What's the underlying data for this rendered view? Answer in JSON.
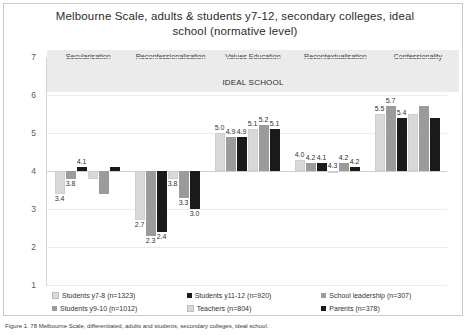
{
  "chart_data": {
    "type": "bar",
    "title": "Melbourne Scale, adults & students y7-12, secondary colleges, ideal school (normative level)",
    "subtitle": "IDEAL SCHOOL",
    "xlabel": "",
    "ylabel": "",
    "ylim": [
      1,
      7
    ],
    "yticks": [
      7,
      6,
      5,
      4,
      3,
      2,
      1
    ],
    "grid": true,
    "legend_position": "bottom",
    "baseline": 4,
    "categories": [
      "Secularisation",
      "Reconfessionalisation",
      "Values Education",
      "Recontextualisation",
      "Confessionality"
    ],
    "series": [
      {
        "name": "Students y7-8 (n=1323)",
        "color": "#d9d9d9",
        "values": [
          3.4,
          2.7,
          5.0,
          4.3,
          5.5
        ]
      },
      {
        "name": "Students y9-10 (n=1012)",
        "color": "#9b9b9b",
        "values": [
          3.8,
          2.3,
          4.9,
          4.2,
          5.7
        ]
      },
      {
        "name": "Students y11-12 (n=920)",
        "color": "#1a1a1a",
        "values": [
          4.1,
          2.4,
          4.9,
          4.2,
          5.4
        ]
      },
      {
        "name": "Teachers (n=804)",
        "color": "#d9d9d9",
        "values": [
          3.8,
          3.8,
          5.1,
          4.0,
          5.5
        ]
      },
      {
        "name": "School leadership (n=307)",
        "color": "#9b9b9b",
        "values": [
          3.4,
          3.3,
          5.2,
          4.2,
          5.7
        ]
      },
      {
        "name": "Parents (n=378)",
        "color": "#1a1a1a",
        "values": [
          4.1,
          3.0,
          5.1,
          4.1,
          5.4
        ]
      }
    ],
    "value_labels": {
      "Secularisation": [
        "3.4",
        "3.8",
        "4.1"
      ],
      "Reconfessionalisation": [
        "2.7",
        "2.3",
        "2.4",
        "3.8",
        "3.3",
        "3.0"
      ],
      "Values Education": [
        "5.0",
        "4.9",
        "4.9",
        "5.1",
        "5.2",
        "5.1"
      ],
      "Recontextualisation": [
        "4.0",
        "4.2",
        "4.1",
        "4.3",
        "4.2",
        "4.2"
      ],
      "Confessionality": [
        "5.5",
        "5.7",
        "5.4"
      ]
    }
  },
  "legend": {
    "items": [
      {
        "label": "Students y7-8 (n=1323)",
        "color": "#d9d9d9"
      },
      {
        "label": "Students y9-10 (n=1012)",
        "color": "#9b9b9b"
      },
      {
        "label": "Students y11-12 (n=920)",
        "color": "#1a1a1a"
      },
      {
        "label": "Teachers (n=804)",
        "color": "#d9d9d9"
      },
      {
        "label": "School leadership (n=307)",
        "color": "#9b9b9b"
      },
      {
        "label": "Parents (n=378)",
        "color": "#1a1a1a"
      }
    ]
  },
  "caption": "Figure 1. 78 Melbourne Scale, differentiated, adults and students, secondary colleges, ideal school."
}
